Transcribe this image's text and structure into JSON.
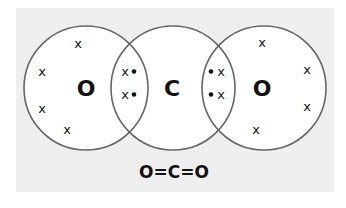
{
  "diagram": {
    "background_color": "#efefef",
    "circle_stroke": "#666666",
    "atoms": [
      {
        "id": "oxygen-left",
        "symbol": "O",
        "cx": 86,
        "cy": 88,
        "r": 62
      },
      {
        "id": "carbon",
        "symbol": "C",
        "cx": 173,
        "cy": 88,
        "r": 62
      },
      {
        "id": "oxygen-right",
        "symbol": "O",
        "cx": 264,
        "cy": 88,
        "r": 62
      }
    ],
    "lone_electrons": {
      "oxygen_left": [
        {
          "symbol": "x",
          "x": 78,
          "y": 48
        },
        {
          "symbol": "x",
          "x": 42,
          "y": 76
        },
        {
          "symbol": "x",
          "x": 42,
          "y": 113
        },
        {
          "symbol": "x",
          "x": 67,
          "y": 134
        }
      ],
      "oxygen_right": [
        {
          "symbol": "x",
          "x": 262,
          "y": 47
        },
        {
          "symbol": "x",
          "x": 307,
          "y": 74
        },
        {
          "symbol": "x",
          "x": 307,
          "y": 111
        },
        {
          "symbol": "x",
          "x": 256,
          "y": 134
        }
      ]
    },
    "shared_electrons": {
      "left_bond": [
        {
          "cross": "x",
          "dot": "•",
          "label": "x•",
          "y": 76
        },
        {
          "cross": "x",
          "dot": "•",
          "label": "x•",
          "y": 99
        }
      ],
      "right_bond": [
        {
          "cross": "x",
          "dot": "•",
          "label": "•x",
          "y": 76
        },
        {
          "cross": "x",
          "dot": "•",
          "label": "•x",
          "y": 99
        }
      ]
    },
    "formula": "O=C=O"
  }
}
